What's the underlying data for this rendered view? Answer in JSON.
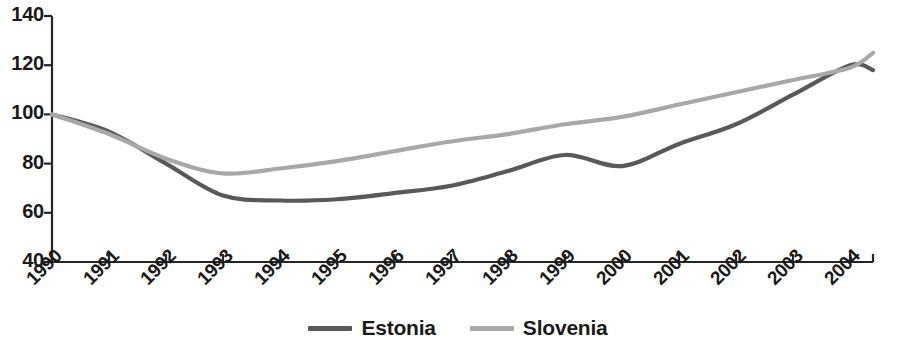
{
  "chart_data": {
    "type": "line",
    "title": "",
    "subtitle": "",
    "xlabel": "",
    "ylabel": "",
    "categories": [
      "1990",
      "1991",
      "1992",
      "1993",
      "1994",
      "1995",
      "1996",
      "1997",
      "1998",
      "1999",
      "2000",
      "2001",
      "2002",
      "2003",
      "2004"
    ],
    "x": [
      1990,
      1991,
      1992,
      1993,
      1994,
      1995,
      1996,
      1997,
      1998,
      1999,
      2000,
      2001,
      2002,
      2003,
      2004
    ],
    "xlim": [
      1990,
      2004
    ],
    "ylim": [
      40,
      140
    ],
    "yticks": [
      40,
      60,
      80,
      100,
      120,
      140
    ],
    "ytick_labels": [
      "40",
      "60",
      "80",
      "100",
      "120",
      "140"
    ],
    "grid": false,
    "legend_position": "bottom-center",
    "series": [
      {
        "name": "Estonia",
        "color": "#595959",
        "values": [
          100,
          93,
          80,
          67,
          65,
          65.5,
          68,
          71,
          77,
          83.5,
          79,
          88,
          96,
          108,
          120
        ]
      },
      {
        "name": "Slovenia",
        "color": "#a8a8a8",
        "values": [
          100,
          92,
          82,
          76,
          78,
          81,
          85,
          89,
          92,
          96,
          99,
          104,
          109,
          114,
          119
        ]
      }
    ],
    "series_end_extension": {
      "Estonia": 118,
      "Slovenia": 125
    },
    "annotations": []
  },
  "axes": {
    "y_tick_labels": [
      "140",
      "120",
      "100",
      "80",
      "60",
      "40"
    ],
    "x_tick_labels": [
      "1990",
      "1991",
      "1992",
      "1993",
      "1994",
      "1995",
      "1996",
      "1997",
      "1998",
      "1999",
      "2000",
      "2001",
      "2002",
      "2003",
      "2004"
    ],
    "axis_color": "#262626"
  },
  "legend": {
    "items": [
      {
        "label": "Estonia",
        "color": "#595959"
      },
      {
        "label": "Slovenia",
        "color": "#a8a8a8"
      }
    ]
  }
}
